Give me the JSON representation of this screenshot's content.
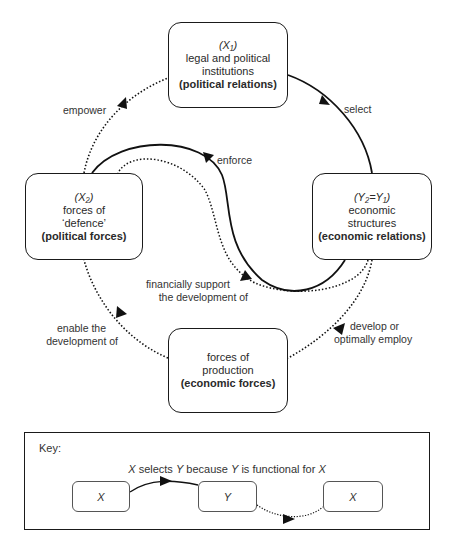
{
  "nodes": {
    "top": {
      "symbol": "(X₁)",
      "line1": "legal and political",
      "line2": "institutions",
      "category": "(political relations)"
    },
    "left": {
      "symbol": "(X₂)",
      "line1": "forces of",
      "line2": "‘defence’",
      "category": "(political forces)"
    },
    "right": {
      "symbol": "(Y₂=Y₁)",
      "line1": "economic",
      "line2": "structures",
      "category": "(economic relations)"
    },
    "bottom": {
      "line1": "forces of",
      "line2": "production",
      "category": "(economic forces)"
    }
  },
  "edges": {
    "select": "select",
    "empower": "empower",
    "enforce": "enforce",
    "financially_support_1": "financially support",
    "financially_support_2": "the development of",
    "develop_1": "develop or",
    "develop_2": "optimally employ",
    "enable_1": "enable the",
    "enable_2": "development of"
  },
  "key": {
    "title": "Key:",
    "caption_x1": "X",
    "caption_mid1": " selects ",
    "caption_y1": "Y",
    "caption_mid2": " because ",
    "caption_y2": "Y",
    "caption_mid3": " is functional for ",
    "caption_x2": "X",
    "boxes": [
      "X",
      "Y",
      "X"
    ]
  }
}
